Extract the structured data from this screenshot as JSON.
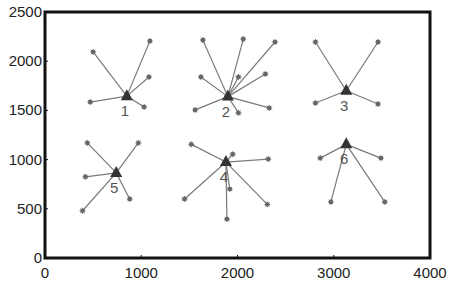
{
  "chart_data": {
    "type": "scatter",
    "title": "",
    "xlabel": "",
    "ylabel": "",
    "xlim": [
      0,
      4000
    ],
    "ylim": [
      0,
      2500
    ],
    "xticks": [
      0,
      1000,
      2000,
      3000,
      4000
    ],
    "yticks": [
      0,
      500,
      1000,
      1500,
      2000,
      2500
    ],
    "grid": false,
    "legend": null,
    "colors": {
      "axis": "#111111",
      "line": "#7a7a7a",
      "marker": "#666666",
      "centroid": "#333333",
      "label": "#555555"
    },
    "clusters": [
      {
        "label": "1",
        "center": [
          850,
          1645
        ],
        "members": [
          [
            500,
            2095
          ],
          [
            1090,
            2205
          ],
          [
            1080,
            1840
          ],
          [
            470,
            1585
          ],
          [
            1030,
            1535
          ]
        ]
      },
      {
        "label": "2",
        "center": [
          1900,
          1640
        ],
        "members": [
          [
            1640,
            2215
          ],
          [
            2060,
            2225
          ],
          [
            2390,
            2195
          ],
          [
            1620,
            1840
          ],
          [
            2010,
            1840
          ],
          [
            2290,
            1870
          ],
          [
            1560,
            1505
          ],
          [
            2010,
            1475
          ],
          [
            2330,
            1525
          ]
        ]
      },
      {
        "label": "3",
        "center": [
          3130,
          1700
        ],
        "members": [
          [
            2810,
            2195
          ],
          [
            3460,
            2195
          ],
          [
            2810,
            1575
          ],
          [
            3460,
            1565
          ]
        ]
      },
      {
        "label": "4",
        "center": [
          1880,
          975
        ],
        "members": [
          [
            1520,
            1155
          ],
          [
            1950,
            1055
          ],
          [
            2320,
            1005
          ],
          [
            1920,
            700
          ],
          [
            1450,
            600
          ],
          [
            2310,
            545
          ],
          [
            1890,
            395
          ]
        ]
      },
      {
        "label": "5",
        "center": [
          740,
          865
        ],
        "members": [
          [
            440,
            1170
          ],
          [
            970,
            1170
          ],
          [
            420,
            825
          ],
          [
            880,
            600
          ],
          [
            390,
            480
          ]
        ]
      },
      {
        "label": "6",
        "center": [
          3130,
          1155
        ],
        "members": [
          [
            2860,
            1015
          ],
          [
            3490,
            1015
          ],
          [
            2970,
            570
          ],
          [
            3530,
            570
          ]
        ]
      }
    ]
  }
}
